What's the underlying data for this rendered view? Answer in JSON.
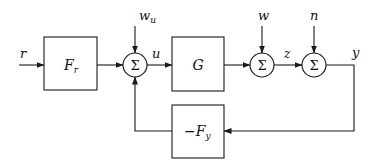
{
  "diagram": {
    "type": "control-block-diagram",
    "blocks": {
      "Fr": {
        "main": "F",
        "sub": "r"
      },
      "G": {
        "main": "G"
      },
      "Fy": {
        "prefix": "−",
        "main": "F",
        "sub": "y"
      }
    },
    "summing_junction_symbol": "Σ",
    "signals": {
      "r": "r",
      "wu_main": "w",
      "wu_sub": "u",
      "u": "u",
      "w": "w",
      "z": "z",
      "n": "n",
      "y": "y"
    },
    "connections": [
      {
        "from": "r",
        "to": "Fr"
      },
      {
        "from": "Fr",
        "to": "sum1"
      },
      {
        "from": "wu",
        "to": "sum1"
      },
      {
        "from": "Fy",
        "to": "sum1"
      },
      {
        "from": "sum1",
        "to": "G",
        "label": "u"
      },
      {
        "from": "G",
        "to": "sum2"
      },
      {
        "from": "w",
        "to": "sum2"
      },
      {
        "from": "sum2",
        "to": "sum3",
        "label": "z"
      },
      {
        "from": "n",
        "to": "sum3"
      },
      {
        "from": "sum3",
        "to": "Fy",
        "label": "y"
      }
    ]
  }
}
